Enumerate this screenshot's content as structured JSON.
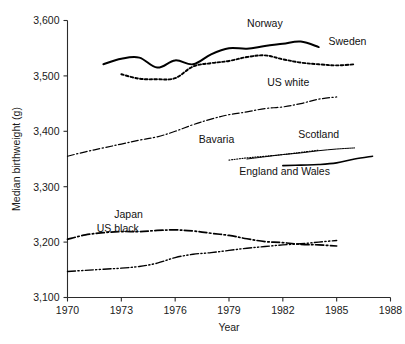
{
  "chart_data": {
    "type": "line",
    "title": "",
    "xlabel": "Year",
    "ylabel": "Median birthweight (g)",
    "xlim": [
      1970,
      1988
    ],
    "ylim": [
      3100,
      3600
    ],
    "xticks": [
      1970,
      1973,
      1976,
      1979,
      1982,
      1985,
      1988
    ],
    "xtick_labels": [
      "1970",
      "1973",
      "1976",
      "1979",
      "1982",
      "1985",
      "1988"
    ],
    "yticks": [
      3100,
      3200,
      3300,
      3400,
      3500,
      3600
    ],
    "ytick_labels": [
      "3,100",
      "3,200",
      "3,300",
      "3,400",
      "3,500",
      "3,600"
    ],
    "grid": false,
    "legend": "inline-labels",
    "series": [
      {
        "name": "Norway",
        "style": "solid-thick",
        "label_x": 1981.0,
        "label_y": 3588,
        "x": [
          1972,
          1973,
          1974,
          1975,
          1976,
          1977,
          1978,
          1979,
          1980,
          1981,
          1982,
          1983,
          1984
        ],
        "values": [
          3521,
          3531,
          3533,
          3515,
          3528,
          3521,
          3539,
          3550,
          3549,
          3554,
          3558,
          3562,
          3552
        ]
      },
      {
        "name": "Sweden",
        "style": "dotted",
        "label_x": 1985.6,
        "label_y": 3556,
        "x": [
          1973,
          1974,
          1975,
          1976,
          1977,
          1978,
          1979,
          1980,
          1981,
          1982,
          1983,
          1984,
          1985,
          1986
        ],
        "values": [
          3503,
          3495,
          3494,
          3496,
          3517,
          3523,
          3527,
          3534,
          3537,
          3530,
          3524,
          3521,
          3519,
          3521
        ]
      },
      {
        "name": "US white",
        "style": "dash-dot",
        "label_x": 1982.3,
        "label_y": 3482,
        "x": [
          1970,
          1971,
          1972,
          1973,
          1974,
          1975,
          1976,
          1977,
          1978,
          1979,
          1980,
          1981,
          1982,
          1983,
          1984,
          1985
        ],
        "values": [
          3355,
          3363,
          3370,
          3377,
          3384,
          3390,
          3400,
          3412,
          3422,
          3430,
          3435,
          3441,
          3444,
          3450,
          3458,
          3462
        ]
      },
      {
        "name": "Bavaria",
        "style": "fine-dotted",
        "label_x": 1978.3,
        "label_y": 3378,
        "x": [
          1979,
          1980,
          1981,
          1982,
          1983,
          1984
        ],
        "values": [
          3348,
          3352,
          3355,
          3358,
          3362,
          3366
        ]
      },
      {
        "name": "Scotland",
        "style": "thin-solid",
        "label_x": 1984.0,
        "label_y": 3388,
        "x": [
          1980,
          1981,
          1982,
          1983,
          1984,
          1985,
          1986
        ],
        "values": [
          3350,
          3354,
          3358,
          3361,
          3365,
          3368,
          3370
        ]
      },
      {
        "name": "England and Wales",
        "style": "solid",
        "label_x": 1982.1,
        "label_y": 3322,
        "x": [
          1982,
          1983,
          1984,
          1985,
          1986,
          1987
        ],
        "values": [
          3338,
          3339,
          3340,
          3343,
          3350,
          3355
        ]
      },
      {
        "name": "Japan",
        "style": "dash-dot-thick",
        "label_x": 1973.4,
        "label_y": 3244,
        "x": [
          1970,
          1971,
          1972,
          1973,
          1974,
          1975,
          1976,
          1977,
          1978,
          1979,
          1980,
          1981,
          1982,
          1983,
          1984,
          1985
        ],
        "values": [
          3205,
          3213,
          3217,
          3219,
          3219,
          3221,
          3222,
          3220,
          3216,
          3212,
          3206,
          3201,
          3199,
          3196,
          3195,
          3193
        ]
      },
      {
        "name": "US black",
        "style": "dash-dot-dot",
        "label_x": 1972.8,
        "label_y": 3218,
        "x": [
          1970,
          1971,
          1972,
          1973,
          1974,
          1975,
          1976,
          1977,
          1978,
          1979,
          1980,
          1981,
          1982,
          1983,
          1984,
          1985
        ],
        "values": [
          3147,
          3149,
          3151,
          3153,
          3156,
          3162,
          3172,
          3178,
          3181,
          3185,
          3189,
          3192,
          3195,
          3197,
          3200,
          3203
        ]
      }
    ]
  }
}
